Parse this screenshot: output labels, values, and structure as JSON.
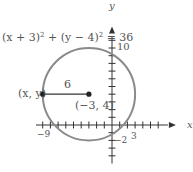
{
  "equation": {
    "parts": [
      "(x + 3)",
      "2",
      " + (y − 4)",
      "2",
      " = 36"
    ]
  },
  "axes": {
    "x_label": "x",
    "y_label": "y",
    "x_tick_labels": [
      "−9",
      "3"
    ],
    "y_tick_labels": [
      "10",
      "−2"
    ],
    "x_range": [
      -10,
      7
    ],
    "y_range": [
      -5,
      12
    ],
    "tick_step": 1
  },
  "circle": {
    "center": [
      -3,
      4
    ],
    "radius": 6,
    "center_label": "(−3, 4)"
  },
  "point": {
    "coords": [
      -9,
      4
    ],
    "label": "(x, y)"
  },
  "radius_label": "6",
  "colors": {
    "circle": "#8a8a8a",
    "axis": "#333333",
    "text": "#555555"
  }
}
